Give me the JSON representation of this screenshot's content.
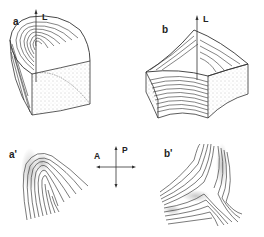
{
  "panels": {
    "a": {
      "label": "a",
      "axis_label": "L"
    },
    "b": {
      "label": "b",
      "axis_label": "L"
    },
    "a_prime": {
      "label": "a'"
    },
    "b_prime": {
      "label": "b'"
    }
  },
  "compass": {
    "anterior": "A",
    "posterior": "P"
  },
  "colors": {
    "line": "#333333",
    "stipple": "#aaaaaa",
    "background": "#ffffff"
  }
}
